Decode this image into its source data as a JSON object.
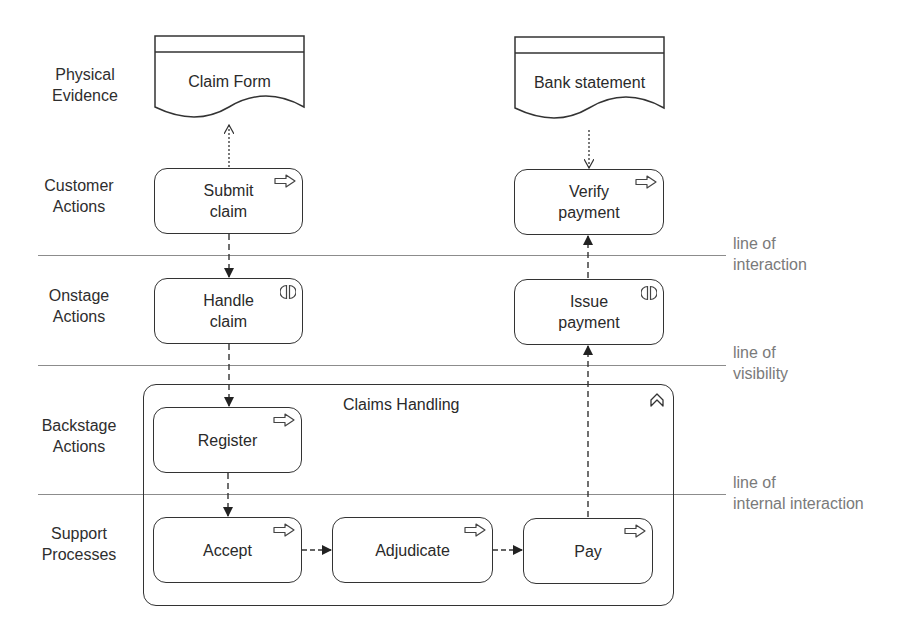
{
  "lanes": [
    {
      "label": "Physical\nEvidence"
    },
    {
      "label": "Customer\nActions"
    },
    {
      "label": "Onstage\nActions"
    },
    {
      "label": "Backstage\nActions"
    },
    {
      "label": "Support\nProcesses"
    }
  ],
  "lines": [
    {
      "label": "line of\ninteraction"
    },
    {
      "label": "line of\nvisibility"
    },
    {
      "label": "line of\ninternal interaction"
    }
  ],
  "evidence": [
    {
      "label": "Claim Form"
    },
    {
      "label": "Bank statement"
    }
  ],
  "nodes": {
    "submit_claim": {
      "label": "Submit\nclaim",
      "icon": "process-arrow-icon"
    },
    "verify_payment": {
      "label": "Verify\npayment",
      "icon": "process-arrow-icon"
    },
    "handle_claim": {
      "label": "Handle\nclaim",
      "icon": "interaction-icon"
    },
    "issue_payment": {
      "label": "Issue\npayment",
      "icon": "interaction-icon"
    },
    "register": {
      "label": "Register",
      "icon": "process-arrow-icon"
    },
    "accept": {
      "label": "Accept",
      "icon": "process-arrow-icon"
    },
    "adjudicate": {
      "label": "Adjudicate",
      "icon": "process-arrow-icon"
    },
    "pay": {
      "label": "Pay",
      "icon": "process-arrow-icon"
    }
  },
  "group": {
    "title": "Claims Handling",
    "icon": "value-stream-chevron-icon"
  },
  "colors": {
    "stroke": "#333333",
    "separator": "#8c8c8c",
    "line_label": "#7a7a7a"
  }
}
